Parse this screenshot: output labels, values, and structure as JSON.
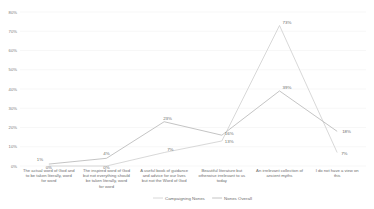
{
  "chart_data": {
    "type": "line",
    "title": "",
    "xlabel": "",
    "ylabel": "",
    "ylim": [
      0,
      80
    ],
    "y_ticks": [
      "0%",
      "10%",
      "20%",
      "30%",
      "40%",
      "50%",
      "60%",
      "70%",
      "80%"
    ],
    "grid": true,
    "legend_position": "bottom",
    "categories": [
      "The actual word of God and to be taken literally, word for word",
      "The inspired word of God but not everything should be taken literally, word for word",
      "A useful book of guidance and advice for our lives but not the Word of God",
      "Beautiful literature but otherwise irrelevant to us today",
      "An irrelevant collection of ancient myths",
      "I do not have a view on this"
    ],
    "series": [
      {
        "name": "Campaigning Nones",
        "color": "#d4d4d4",
        "values": [
          0,
          0,
          7,
          13,
          73,
          7
        ],
        "labels": [
          "0%",
          "0%",
          "7%",
          "13%",
          "73%",
          "7%"
        ]
      },
      {
        "name": "Nones Overall",
        "color": "#bdbdbd",
        "values": [
          1,
          4,
          23,
          16,
          39,
          18
        ],
        "labels": [
          "1%",
          "4%",
          "23%",
          "16%",
          "39%",
          "18%"
        ]
      }
    ]
  }
}
